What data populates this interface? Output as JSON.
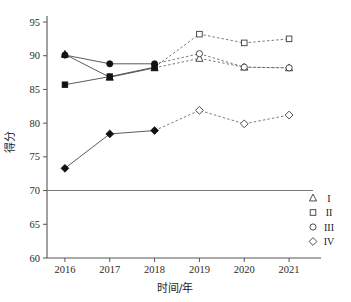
{
  "chart_data": {
    "type": "line",
    "title": "",
    "xlabel": "时间/年",
    "ylabel": "得分",
    "categories": [
      "2016",
      "2017",
      "2018",
      "2019",
      "2020",
      "2021"
    ],
    "x": [
      2016,
      2017,
      2018,
      2019,
      2020,
      2021
    ],
    "xlim": [
      2015.6,
      2021.4
    ],
    "ylim": [
      60,
      95
    ],
    "yticks": [
      60,
      65,
      70,
      75,
      80,
      85,
      90,
      95
    ],
    "ytick_labels": [
      "60",
      "65",
      "70",
      "75",
      "80",
      "85",
      "90",
      "95"
    ],
    "grid": false,
    "legend_position": "right-outside",
    "reference_line": {
      "value": 70,
      "label": "70",
      "style": "solid"
    },
    "solid_segment_years": [
      "2016",
      "2017",
      "2018"
    ],
    "dashed_segment_years": [
      "2019",
      "2020",
      "2021"
    ],
    "marker_fill_note": "filled markers 2016-2018, hollow markers 2019-2021",
    "series": [
      {
        "name": "I",
        "marker": "triangle",
        "values": [
          90.2,
          86.8,
          88.2,
          89.6,
          88.3,
          88.2
        ]
      },
      {
        "name": "II",
        "marker": "square",
        "values": [
          85.7,
          86.9,
          88.3,
          93.2,
          91.9,
          92.5
        ]
      },
      {
        "name": "III",
        "marker": "circle",
        "values": [
          90.1,
          88.8,
          88.8,
          90.3,
          88.3,
          88.2
        ]
      },
      {
        "name": "IV",
        "marker": "diamond",
        "values": [
          73.3,
          78.4,
          78.9,
          81.9,
          79.9,
          81.2
        ]
      }
    ]
  },
  "legend": {
    "entries": [
      {
        "label": "I",
        "marker": "triangle"
      },
      {
        "label": "II",
        "marker": "square"
      },
      {
        "label": "III",
        "marker": "circle"
      },
      {
        "label": "IV",
        "marker": "diamond"
      }
    ]
  },
  "colors": {
    "axis": "#555555",
    "marker_filled": "#111111",
    "marker_hollow_stroke": "#3a3a3a",
    "line_solid": "#4a4a4a",
    "line_dashed": "#6a6a6a",
    "reference_line": "#777777",
    "background": "#ffffff"
  }
}
